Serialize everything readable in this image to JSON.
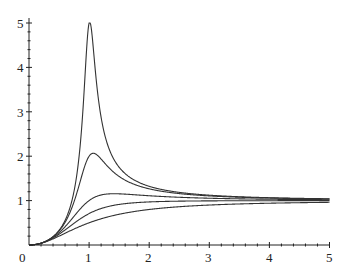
{
  "chart_data": {
    "type": "line",
    "title": "",
    "xlabel": "",
    "ylabel": "",
    "xlim": [
      0,
      5
    ],
    "ylim": [
      0,
      5
    ],
    "grid": false,
    "legend": null,
    "x_ticks": [
      "0",
      "1",
      "2",
      "3",
      "4",
      "5"
    ],
    "y_ticks": [
      "1",
      "2",
      "3",
      "4",
      "5"
    ],
    "origin_label": "0",
    "minor_ticks_per_unit": 5,
    "line_color": "#333333",
    "series": [
      {
        "name": "zeta=0.1",
        "zeta": 0.1,
        "x": [
          0,
          0.5,
          0.8,
          0.9,
          1.0,
          1.1,
          1.2,
          1.5,
          2,
          3,
          4,
          5
        ],
        "values": [
          0,
          0.33,
          1.57,
          2.85,
          5.0,
          2.85,
          1.99,
          1.76,
          1.33,
          1.12,
          1.07,
          1.04
        ]
      },
      {
        "name": "zeta=0.25",
        "zeta": 0.25,
        "x": [
          0,
          0.5,
          0.8,
          1.0,
          1.05,
          1.2,
          1.5,
          2,
          3,
          4,
          5
        ],
        "values": [
          0,
          0.32,
          1.32,
          2.0,
          2.05,
          1.82,
          1.53,
          1.28,
          1.11,
          1.06,
          1.04
        ]
      },
      {
        "name": "zeta=0.5",
        "zeta": 0.5,
        "x": [
          0,
          0.5,
          1.0,
          1.41,
          2,
          3,
          4,
          5
        ],
        "values": [
          0,
          0.28,
          1.0,
          1.15,
          1.11,
          1.05,
          1.03,
          1.02
        ]
      },
      {
        "name": "zeta=0.707",
        "zeta": 0.707,
        "x": [
          0,
          0.5,
          1.0,
          2,
          3,
          4,
          5
        ],
        "values": [
          0,
          0.24,
          0.71,
          0.97,
          0.99,
          1.0,
          1.0
        ]
      },
      {
        "name": "zeta=1",
        "zeta": 1.0,
        "x": [
          0,
          0.5,
          1.0,
          2,
          3,
          4,
          5
        ],
        "values": [
          0,
          0.2,
          0.5,
          0.8,
          0.9,
          0.94,
          0.96
        ]
      }
    ]
  }
}
